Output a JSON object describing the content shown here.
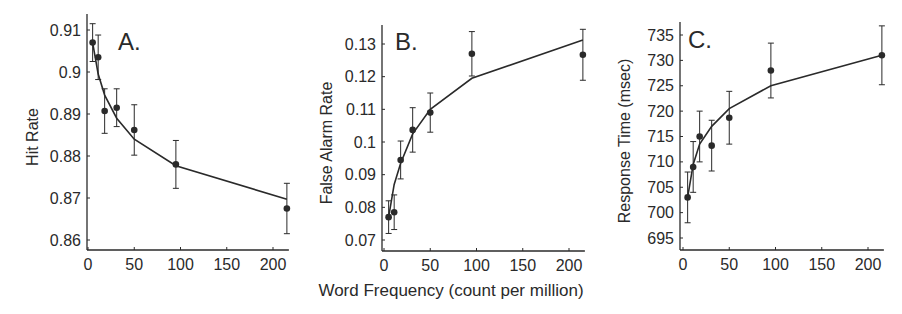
{
  "figure": {
    "xlabel": "Word Frequency (count per million)",
    "colors": {
      "ink": "#2a2a2a",
      "background": "#ffffff"
    }
  },
  "chart_data": [
    {
      "type": "line",
      "panel": "A.",
      "title": "",
      "xlabel": "Word Frequency (count per million)",
      "ylabel": "Hit Rate",
      "xlim": [
        0,
        215
      ],
      "ylim": [
        0.8575,
        0.912
      ],
      "xticks": [
        0,
        50,
        100,
        150,
        200
      ],
      "yticks": [
        0.86,
        0.87,
        0.88,
        0.89,
        0.9,
        0.91
      ],
      "ytick_labels": [
        "0.86",
        "0.87",
        "0.88",
        "0.89",
        "0.9",
        "0.91"
      ],
      "grid": false,
      "series": [
        {
          "name": "observed",
          "style": "points-with-errorbars",
          "x": [
            5,
            11,
            18,
            31,
            50,
            95,
            215
          ],
          "y": [
            0.907,
            0.9035,
            0.8907,
            0.8915,
            0.8862,
            0.878,
            0.8675
          ],
          "err": [
            0.0045,
            0.0053,
            0.0053,
            0.0045,
            0.006,
            0.0057,
            0.006
          ]
        },
        {
          "name": "model fit",
          "style": "line",
          "x": [
            5,
            11,
            18,
            31,
            50,
            95,
            215
          ],
          "y": [
            0.907,
            0.8995,
            0.8945,
            0.889,
            0.884,
            0.8777,
            0.8697
          ]
        }
      ]
    },
    {
      "type": "line",
      "panel": "B.",
      "title": "",
      "xlabel": "Word Frequency (count per million)",
      "ylabel": "False Alarm Rate",
      "xlim": [
        0,
        215
      ],
      "ylim": [
        0.067,
        0.135
      ],
      "xticks": [
        0,
        50,
        100,
        150,
        200
      ],
      "yticks": [
        0.07,
        0.08,
        0.09,
        0.1,
        0.11,
        0.12,
        0.13
      ],
      "ytick_labels": [
        "0.07",
        "0.08",
        "0.09",
        "0.1",
        "0.11",
        "0.12",
        "0.13"
      ],
      "grid": false,
      "series": [
        {
          "name": "observed",
          "style": "points-with-errorbars",
          "x": [
            5,
            11,
            18,
            31,
            50,
            95,
            215
          ],
          "y": [
            0.077,
            0.0785,
            0.0945,
            0.1037,
            0.109,
            0.127,
            0.1267
          ],
          "err": [
            0.005,
            0.0053,
            0.0058,
            0.0068,
            0.006,
            0.0068,
            0.0078
          ]
        },
        {
          "name": "model fit",
          "style": "line",
          "x": [
            5,
            11,
            18,
            31,
            50,
            95,
            215
          ],
          "y": [
            0.077,
            0.087,
            0.0935,
            0.1025,
            0.11,
            0.1195,
            0.1312
          ]
        }
      ]
    },
    {
      "type": "line",
      "panel": "C.",
      "title": "",
      "xlabel": "Word Frequency (count per million)",
      "ylabel": "Response Time (msec)",
      "xlim": [
        0,
        215
      ],
      "ylim": [
        693,
        737
      ],
      "xticks": [
        0,
        50,
        100,
        150,
        200
      ],
      "yticks": [
        695,
        700,
        705,
        710,
        715,
        720,
        725,
        730,
        735
      ],
      "ytick_labels": [
        "695",
        "700",
        "705",
        "710",
        "715",
        "720",
        "725",
        "730",
        "735"
      ],
      "grid": false,
      "series": [
        {
          "name": "observed",
          "style": "points-with-errorbars",
          "x": [
            5,
            11,
            18,
            31,
            50,
            95,
            215
          ],
          "y": [
            703,
            709,
            715,
            713.2,
            718.7,
            728,
            731
          ],
          "err": [
            5,
            5,
            5,
            5,
            5.2,
            5.4,
            5.8
          ]
        },
        {
          "name": "model fit",
          "style": "line",
          "x": [
            5,
            11,
            18,
            31,
            50,
            95,
            215
          ],
          "y": [
            703,
            709.5,
            713.5,
            717,
            720.5,
            725,
            731
          ]
        }
      ]
    }
  ]
}
